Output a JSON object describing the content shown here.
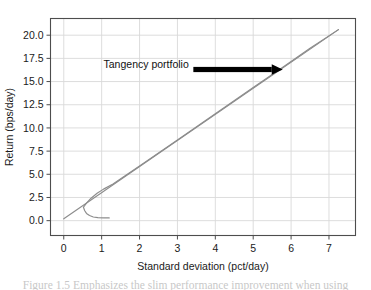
{
  "figure": {
    "caption": "Figure 1.5  Emphasizes the slim performance improvement when using"
  },
  "chart_data": {
    "type": "line",
    "title": "",
    "xlabel": "Standard deviation (pct/day)",
    "ylabel": "Return (bps/day)",
    "xlim": [
      -0.35,
      7.7
    ],
    "ylim": [
      -1.6,
      21.8
    ],
    "xticks": [
      0,
      1,
      2,
      3,
      4,
      5,
      6,
      7
    ],
    "xtick_labels": [
      "0",
      "1",
      "2",
      "3",
      "4",
      "5",
      "6",
      "7"
    ],
    "yticks": [
      0.0,
      2.5,
      5.0,
      7.5,
      10.0,
      12.5,
      15.0,
      17.5,
      20.0
    ],
    "ytick_labels": [
      "0.0",
      "2.5",
      "5.0",
      "7.5",
      "10.0",
      "12.5",
      "15.0",
      "17.5",
      "20.0"
    ],
    "grid": true,
    "grid_color": "#d9d9d9",
    "frame_color": "#4d4d4d",
    "legend": null,
    "line_color": "#8c8c8c",
    "series": [
      {
        "name": "Capital allocation line",
        "type": "line",
        "x": [
          0.0,
          7.25
        ],
        "y": [
          0.2,
          20.6
        ]
      },
      {
        "name": "Efficient frontier (upper branch)",
        "type": "line",
        "x": [
          0.52,
          0.6,
          0.72,
          0.88,
          1.05,
          1.3,
          1.6,
          2.0,
          2.5,
          3.0,
          3.6,
          4.2,
          5.0,
          5.8,
          6.5,
          7.25
        ],
        "y": [
          1.45,
          1.9,
          2.42,
          2.95,
          3.4,
          3.95,
          4.78,
          5.9,
          7.3,
          8.7,
          10.4,
          12.1,
          14.35,
          16.6,
          18.6,
          20.6
        ]
      },
      {
        "name": "Minimum variance branch (lower)",
        "type": "line",
        "x": [
          0.52,
          0.55,
          0.6,
          0.68,
          0.78,
          0.9,
          1.05,
          1.2
        ],
        "y": [
          1.45,
          1.1,
          0.78,
          0.55,
          0.4,
          0.32,
          0.3,
          0.3
        ]
      }
    ],
    "annotations": [
      {
        "name": "tangency-portfolio",
        "text": "Tangency portfolio",
        "text_x": 1.05,
        "text_y": 16.45,
        "arrow": {
          "x_start": 3.42,
          "x_end": 5.78,
          "y": 16.3,
          "color": "#000000",
          "direction": "right"
        }
      }
    ]
  }
}
